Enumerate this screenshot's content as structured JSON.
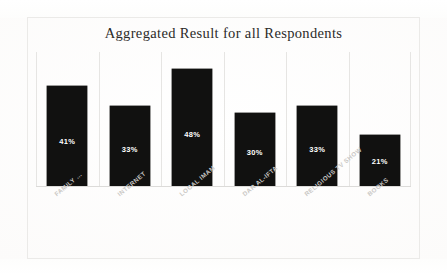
{
  "document": {
    "kind": "scanned-bar-chart-figure",
    "background_color": "#fbfaf9",
    "frame_color": "#ebeae8"
  },
  "chart_data": {
    "type": "bar",
    "title": "Aggregated Result for all Respondents",
    "subtitle": "",
    "xlabel": "",
    "ylabel": "",
    "ylim": [
      0,
      55
    ],
    "grid": "vertical-category-separators",
    "legend": "none",
    "orientation": "vertical",
    "bar_color": "#111110",
    "data_label_color": "#ffffff",
    "category_label_color": "#c9c7c4",
    "category_label_rotation": -40,
    "categories": [
      "FAMILY …",
      "INTERNET",
      "LOCAL IMAM",
      "DAR AL-IFTA",
      "RELIGIOUS TV SHOW",
      "BOOKS"
    ],
    "values": [
      41,
      33,
      48,
      30,
      33,
      21
    ],
    "data_labels": [
      "41%",
      "33%",
      "48%",
      "30%",
      "33%",
      "21%"
    ],
    "series": [
      {
        "name": "Aggregated Result",
        "values": [
          41,
          33,
          48,
          30,
          33,
          21
        ]
      }
    ]
  },
  "bars": [
    {
      "category": "FAMILY …",
      "value": 41,
      "label": "41%"
    },
    {
      "category": "INTERNET",
      "value": 33,
      "label": "33%"
    },
    {
      "category": "LOCAL IMAM",
      "value": 48,
      "label": "48%"
    },
    {
      "category": "DAR AL-IFTA",
      "value": 30,
      "label": "30%"
    },
    {
      "category": "RELIGIOUS TV SHOW",
      "value": 33,
      "label": "33%"
    },
    {
      "category": "BOOKS",
      "value": 21,
      "label": "21%"
    }
  ]
}
